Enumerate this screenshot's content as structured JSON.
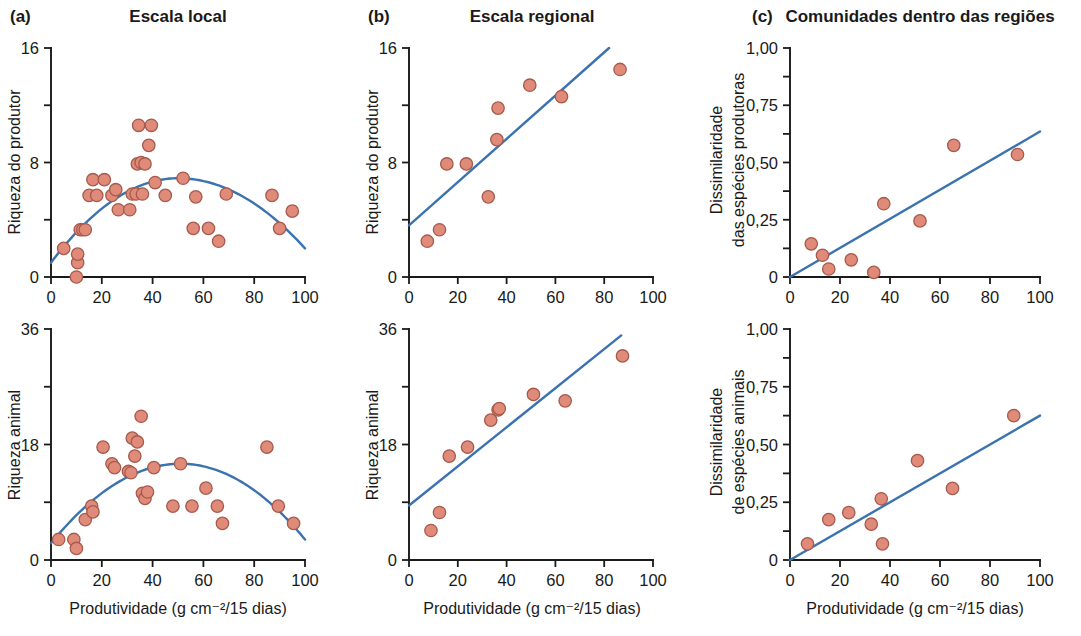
{
  "figure": {
    "background": "#ffffff",
    "point_fill": "#e08a79",
    "point_stroke": "#a65a4c",
    "line_color": "#3b72b0",
    "axis_color": "#1a1a1a"
  },
  "columns": [
    {
      "letter": "(a)",
      "title": "Escala local"
    },
    {
      "letter": "(b)",
      "title": "Escala regional"
    },
    {
      "letter": "(c)",
      "title": "Comunidades dentro das regiões"
    }
  ],
  "xaxis_label": "Produtividade (g cm⁻²/15 dias)",
  "xticks": [
    "0",
    "20",
    "40",
    "60",
    "80",
    "100"
  ],
  "yticks_richness16": [
    "0",
    "8",
    "16"
  ],
  "yticks_richness36": [
    "0",
    "18",
    "36"
  ],
  "yticks_dissim": [
    "0",
    "0,25",
    "0,50",
    "0,75",
    "1,00"
  ],
  "ylabels": {
    "producer_richness": "Riqueza do produtor",
    "animal_richness": "Riqueza animal",
    "producer_dissim_line1": "Dissimilaridade",
    "producer_dissim_line2": "das espécies produtoras",
    "animal_dissim_line1": "Dissimilaridade",
    "animal_dissim_line2": "de espécies animais"
  },
  "chart_data": [
    {
      "id": "a-top",
      "type": "scatter",
      "title": "Escala local",
      "panel": "(a)",
      "xlabel": "Produtividade (g cm⁻²/15 dias)",
      "ylabel": "Riqueza do produtor",
      "xlim": [
        0,
        100
      ],
      "ylim": [
        0,
        16
      ],
      "xticks": [
        0,
        20,
        40,
        60,
        80,
        100
      ],
      "yticks": [
        0,
        8,
        16
      ],
      "grid": false,
      "legend": "none",
      "fit": {
        "kind": "quadratic-hump",
        "peak_x": 50,
        "peak_y": 6.9,
        "y_at_0": 1.0,
        "y_at_100": 2.0
      },
      "points": [
        [
          5.0,
          2.0
        ],
        [
          10.0,
          0.0
        ],
        [
          10.5,
          1.0
        ],
        [
          10.5,
          1.6
        ],
        [
          11.5,
          3.3
        ],
        [
          12.5,
          3.3
        ],
        [
          13.5,
          3.3
        ],
        [
          15.0,
          5.7
        ],
        [
          16.5,
          6.8
        ],
        [
          18.0,
          5.7
        ],
        [
          21.0,
          6.8
        ],
        [
          24.0,
          5.7
        ],
        [
          25.5,
          6.1
        ],
        [
          26.5,
          4.7
        ],
        [
          31.0,
          4.7
        ],
        [
          32.0,
          5.8
        ],
        [
          33.5,
          5.8
        ],
        [
          34.0,
          7.9
        ],
        [
          34.5,
          10.6
        ],
        [
          35.5,
          8.0
        ],
        [
          36.0,
          5.8
        ],
        [
          37.0,
          7.9
        ],
        [
          38.5,
          9.2
        ],
        [
          39.5,
          10.6
        ],
        [
          41.0,
          6.6
        ],
        [
          45.0,
          5.7
        ],
        [
          52.0,
          6.9
        ],
        [
          56.0,
          3.4
        ],
        [
          57.0,
          5.6
        ],
        [
          62.0,
          3.4
        ],
        [
          66.0,
          2.5
        ],
        [
          69.0,
          5.8
        ],
        [
          87.0,
          5.7
        ],
        [
          90.0,
          3.4
        ],
        [
          95.0,
          4.6
        ]
      ]
    },
    {
      "id": "b-top",
      "type": "scatter",
      "title": "Escala regional",
      "panel": "(b)",
      "xlabel": "Produtividade (g cm⁻²/15 dias)",
      "ylabel": "Riqueza do produtor",
      "xlim": [
        0,
        100
      ],
      "ylim": [
        0,
        16
      ],
      "xticks": [
        0,
        20,
        40,
        60,
        80,
        100
      ],
      "yticks": [
        0,
        8,
        16
      ],
      "grid": false,
      "legend": "none",
      "fit": {
        "kind": "linear",
        "x0": 0,
        "y0": 3.6,
        "x1": 82,
        "y1": 16.0
      },
      "points": [
        [
          7.5,
          2.5
        ],
        [
          12.5,
          3.3
        ],
        [
          15.5,
          7.9
        ],
        [
          23.5,
          7.9
        ],
        [
          32.5,
          5.6
        ],
        [
          36.0,
          9.6
        ],
        [
          36.5,
          11.8
        ],
        [
          49.5,
          13.4
        ],
        [
          62.5,
          12.6
        ],
        [
          86.5,
          14.5
        ]
      ]
    },
    {
      "id": "c-top",
      "type": "scatter",
      "title": "Comunidades dentro das regiões",
      "panel": "(c)",
      "xlabel": "Produtividade (g cm⁻²/15 dias)",
      "ylabel": "Dissimilaridade das espécies produtoras",
      "xlim": [
        0,
        100
      ],
      "ylim": [
        0,
        1.0
      ],
      "xticks": [
        0,
        20,
        40,
        60,
        80,
        100
      ],
      "yticks": [
        0,
        0.25,
        0.5,
        0.75,
        1.0
      ],
      "ytick_labels": [
        "0",
        "0,25",
        "0,50",
        "0,75",
        "1,00"
      ],
      "grid": false,
      "legend": "none",
      "fit": {
        "kind": "linear",
        "x0": 0,
        "y0": 0.0,
        "x1": 100,
        "y1": 0.635
      },
      "points": [
        [
          8.5,
          0.145
        ],
        [
          13.0,
          0.095
        ],
        [
          15.5,
          0.035
        ],
        [
          24.5,
          0.075
        ],
        [
          33.5,
          0.02
        ],
        [
          37.5,
          0.32
        ],
        [
          52.0,
          0.245
        ],
        [
          65.5,
          0.575
        ],
        [
          91.0,
          0.535
        ]
      ]
    },
    {
      "id": "a-bottom",
      "type": "scatter",
      "title": "Escala local",
      "panel": "(a)",
      "xlabel": "Produtividade (g cm⁻²/15 dias)",
      "ylabel": "Riqueza animal",
      "xlim": [
        0,
        100
      ],
      "ylim": [
        0,
        36
      ],
      "xticks": [
        0,
        20,
        40,
        60,
        80,
        100
      ],
      "yticks": [
        0,
        18,
        36
      ],
      "grid": false,
      "legend": "none",
      "fit": {
        "kind": "quadratic-hump",
        "peak_x": 51,
        "peak_y": 15.0,
        "y_at_0": 2.6,
        "y_at_100": 3.2
      },
      "points": [
        [
          3.0,
          3.2
        ],
        [
          9.0,
          3.2
        ],
        [
          10.0,
          1.8
        ],
        [
          13.5,
          6.3
        ],
        [
          16.0,
          8.4
        ],
        [
          16.5,
          7.5
        ],
        [
          20.5,
          17.6
        ],
        [
          24.0,
          15.0
        ],
        [
          25.0,
          14.4
        ],
        [
          30.5,
          13.8
        ],
        [
          31.5,
          13.6
        ],
        [
          32.0,
          19.0
        ],
        [
          33.0,
          16.2
        ],
        [
          34.0,
          18.4
        ],
        [
          35.5,
          22.4
        ],
        [
          36.0,
          10.4
        ],
        [
          37.0,
          9.6
        ],
        [
          38.0,
          10.6
        ],
        [
          40.5,
          14.4
        ],
        [
          48.0,
          8.4
        ],
        [
          51.0,
          15.0
        ],
        [
          55.5,
          8.4
        ],
        [
          61.0,
          11.2
        ],
        [
          65.5,
          8.4
        ],
        [
          67.5,
          5.7
        ],
        [
          85.0,
          17.6
        ],
        [
          89.5,
          8.4
        ],
        [
          95.5,
          5.7
        ]
      ]
    },
    {
      "id": "b-bottom",
      "type": "scatter",
      "title": "Escala regional",
      "panel": "(b)",
      "xlabel": "Produtividade (g cm⁻²/15 dias)",
      "ylabel": "Riqueza animal",
      "xlim": [
        0,
        100
      ],
      "ylim": [
        0,
        36
      ],
      "xticks": [
        0,
        20,
        40,
        60,
        80,
        100
      ],
      "yticks": [
        0,
        18,
        36
      ],
      "grid": false,
      "legend": "none",
      "fit": {
        "kind": "linear",
        "x0": 0,
        "y0": 8.5,
        "x1": 87,
        "y1": 35.0
      },
      "points": [
        [
          9.0,
          4.6
        ],
        [
          12.5,
          7.4
        ],
        [
          16.5,
          16.2
        ],
        [
          24.0,
          17.6
        ],
        [
          33.5,
          21.8
        ],
        [
          36.5,
          23.4
        ],
        [
          37.0,
          23.6
        ],
        [
          51.0,
          25.8
        ],
        [
          64.0,
          24.8
        ],
        [
          87.5,
          31.8
        ]
      ]
    },
    {
      "id": "c-bottom",
      "type": "scatter",
      "title": "Comunidades dentro das regiões",
      "panel": "(c)",
      "xlabel": "Produtividade (g cm⁻²/15 dias)",
      "ylabel": "Dissimilaridade de espécies animais",
      "xlim": [
        0,
        100
      ],
      "ylim": [
        0,
        1.0
      ],
      "xticks": [
        0,
        20,
        40,
        60,
        80,
        100
      ],
      "yticks": [
        0,
        0.25,
        0.5,
        0.75,
        1.0
      ],
      "ytick_labels": [
        "0",
        "0,25",
        "0,50",
        "0,75",
        "1,00"
      ],
      "grid": false,
      "legend": "none",
      "fit": {
        "kind": "linear",
        "x0": 0,
        "y0": 0.0,
        "x1": 100,
        "y1": 0.625
      },
      "points": [
        [
          7.0,
          0.07
        ],
        [
          15.5,
          0.175
        ],
        [
          23.5,
          0.205
        ],
        [
          32.5,
          0.155
        ],
        [
          36.5,
          0.265
        ],
        [
          37.0,
          0.07
        ],
        [
          51.0,
          0.43
        ],
        [
          65.0,
          0.31
        ],
        [
          89.5,
          0.625
        ]
      ]
    }
  ]
}
